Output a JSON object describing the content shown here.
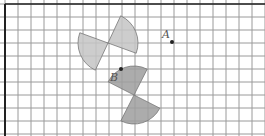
{
  "diagram": {
    "grid": {
      "x0": 5,
      "y0": 4,
      "cell": 13,
      "cols": 20,
      "rows": 10,
      "line_color": "#9a9a9a",
      "border_color": "#222222"
    },
    "points": [
      {
        "label": "A",
        "x": 172,
        "y": 42,
        "label_dx": -10,
        "label_dy": -4
      },
      {
        "label": "B",
        "x": 121,
        "y": 69,
        "label_dx": -11,
        "label_dy": 12
      }
    ],
    "sectors": [
      {
        "name": "upper-left-sector",
        "cx": 108,
        "cy": 43,
        "r": 30,
        "a1": 245,
        "a2": 160,
        "fill": "#c4c4c4"
      },
      {
        "name": "upper-right-sector",
        "cx": 108,
        "cy": 43,
        "r": 30,
        "a1": 65,
        "a2": -20,
        "fill": "#c4c4c4"
      },
      {
        "name": "lower-upper-sector",
        "cx": 134,
        "cy": 95,
        "r": 29,
        "a1": 243,
        "a2": 333,
        "fill": "#9e9e9e"
      },
      {
        "name": "lower-lower-sector",
        "cx": 134,
        "cy": 95,
        "r": 29,
        "a1": 63,
        "a2": 153,
        "fill": "#9e9e9e"
      }
    ]
  }
}
